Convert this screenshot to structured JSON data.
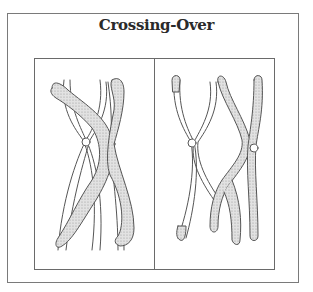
{
  "figure": {
    "title": "Crossing-Over",
    "panels": [
      {
        "id": "before",
        "description": "Homologous chromosomes with crossed chromatids (chiasmata)"
      },
      {
        "id": "after",
        "description": "Chromatids after exchange of segments"
      }
    ],
    "colors": {
      "border": "#6a6a6a",
      "outline": "#555555",
      "stipple": "#cfcfcf",
      "title": "#2a2a2a"
    }
  }
}
